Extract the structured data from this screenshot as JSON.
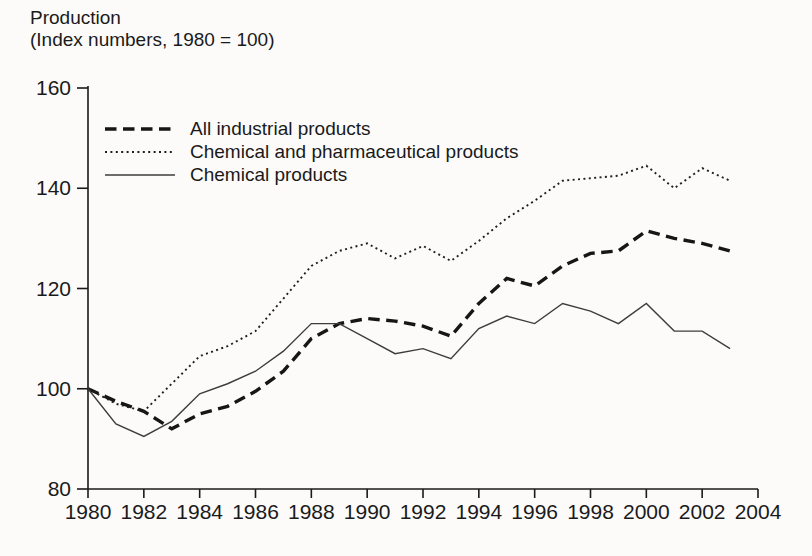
{
  "title": {
    "line1": "Production",
    "line2": "(Index numbers, 1980 = 100)"
  },
  "chart_data": {
    "type": "line",
    "title": "Production (Index numbers, 1980 = 100)",
    "xlabel": "",
    "ylabel": "Index numbers, 1980 = 100",
    "xlim": [
      1980,
      2004
    ],
    "ylim": [
      80,
      160
    ],
    "x_ticks": [
      1980,
      1982,
      1984,
      1986,
      1988,
      1990,
      1992,
      1994,
      1996,
      1998,
      2000,
      2002,
      2004
    ],
    "y_ticks": [
      80,
      100,
      120,
      140,
      160
    ],
    "grid": false,
    "legend_position": "top-left-inside",
    "x": [
      1980,
      1981,
      1982,
      1983,
      1984,
      1985,
      1986,
      1987,
      1988,
      1989,
      1990,
      1991,
      1992,
      1993,
      1994,
      1995,
      1996,
      1997,
      1998,
      1999,
      2000,
      2001,
      2002,
      2003
    ],
    "series": [
      {
        "name": "All industrial products",
        "style": "dashed-thick",
        "values": [
          100,
          97.5,
          95.5,
          92,
          95,
          96.5,
          99.5,
          103.5,
          110,
          113,
          114,
          113.5,
          112.5,
          110.5,
          117,
          122,
          120.5,
          124.5,
          127,
          127.5,
          131.5,
          130,
          129,
          127.5
        ]
      },
      {
        "name": "Chemical and pharmaceutical products",
        "style": "dotted",
        "values": [
          100,
          97,
          95.5,
          101,
          106.5,
          108.5,
          111.5,
          118,
          124.5,
          127.5,
          129,
          126,
          128.5,
          125.5,
          129.5,
          134,
          137.5,
          141.5,
          142,
          142.5,
          144.5,
          140,
          144,
          141.5
        ]
      },
      {
        "name": "Chemical products",
        "style": "solid-thin",
        "values": [
          100,
          93,
          90.5,
          93.5,
          99,
          101,
          103.5,
          107.5,
          113,
          113,
          110,
          107,
          108,
          106,
          112,
          114.5,
          113,
          117,
          115.5,
          113,
          117,
          111.5,
          111.5,
          108
        ]
      }
    ]
  }
}
